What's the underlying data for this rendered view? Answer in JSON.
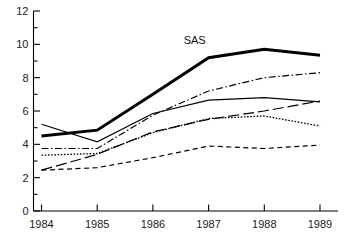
{
  "chart_data": {
    "type": "line",
    "title": "",
    "subtitle": "",
    "xlabel": "",
    "ylabel": "",
    "x": [
      1984,
      1985,
      1986,
      1987,
      1988,
      1989
    ],
    "xtick_labels": [
      "1984",
      "1985",
      "1986",
      "1987",
      "1988",
      "1989"
    ],
    "ytick_labels": [
      "0",
      "2",
      "4",
      "6",
      "8",
      "10",
      "12"
    ],
    "yticks": [
      0,
      2,
      4,
      6,
      8,
      10,
      12
    ],
    "yticks_minor": [
      1,
      3,
      5,
      7,
      9,
      11
    ],
    "xlim": [
      1984,
      1989
    ],
    "ylim": [
      0,
      12
    ],
    "grid": false,
    "legend_position": "none",
    "annotations": [
      {
        "text": "SAS",
        "x": 1986.75,
        "y": 10.0,
        "series": "SAS"
      }
    ],
    "series": [
      {
        "name": "SAS",
        "style": "solid-thick",
        "stroke_width": 3.0,
        "dash": "none",
        "label_on_chart": "SAS",
        "values": [
          4.5,
          4.85,
          7.0,
          9.2,
          9.7,
          9.35
        ]
      },
      {
        "name": "series-2",
        "style": "dash-dot",
        "stroke_width": 1.2,
        "dash": "7,2.5,1.5,2.5",
        "label_on_chart": "",
        "values": [
          3.75,
          3.75,
          5.75,
          7.2,
          8.0,
          8.3
        ]
      },
      {
        "name": "series-3",
        "style": "solid-thin",
        "stroke_width": 1.1,
        "dash": "none",
        "label_on_chart": "",
        "values": [
          5.2,
          4.15,
          5.85,
          6.65,
          6.8,
          6.55
        ]
      },
      {
        "name": "series-4",
        "style": "long-dash",
        "stroke_width": 1.2,
        "dash": "11,4",
        "label_on_chart": "",
        "values": [
          2.45,
          3.4,
          4.75,
          5.5,
          6.0,
          6.6
        ]
      },
      {
        "name": "series-5",
        "style": "dotted",
        "stroke_width": 1.3,
        "dash": "1.6,1.6",
        "label_on_chart": "",
        "values": [
          3.35,
          3.45,
          4.7,
          5.55,
          5.7,
          5.1
        ]
      },
      {
        "name": "series-6",
        "style": "short-dash",
        "stroke_width": 1.2,
        "dash": "5,3.5",
        "label_on_chart": "",
        "values": [
          2.45,
          2.6,
          3.2,
          3.9,
          3.75,
          3.95
        ]
      }
    ],
    "colors": {
      "line": "#000000",
      "axis": "#000000",
      "text": "#1a1a1a",
      "background": "#ffffff"
    }
  }
}
